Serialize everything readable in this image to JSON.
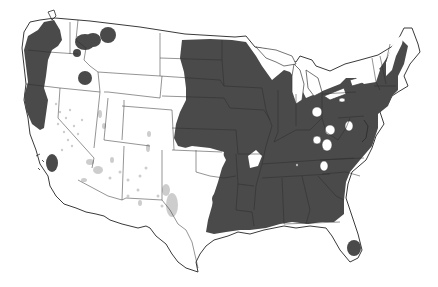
{
  "map": {
    "subject": "United States range distribution map",
    "colors": {
      "background": "#ffffff",
      "range_fill": "#4a4a4a",
      "state_border": "#3a3a3a",
      "land_fill": "#ffffff",
      "stipple": "#b8b8b8"
    },
    "regions": [
      {
        "name": "pacific-northwest-coast",
        "description": "Coastal WA, OR, northern CA"
      },
      {
        "name": "northern-idaho-patches",
        "description": "Northern Idaho / western Montana patches"
      },
      {
        "name": "central-idaho-patch",
        "description": "Small circular patch in Idaho"
      },
      {
        "name": "southern-california-patch",
        "description": "Small patch near Los Angeles"
      },
      {
        "name": "eastern-range",
        "description": "Great Plains east to Atlantic: Dakotas, MN, IA, MO, IL, IN, OH, KY, TN, AR, LA, MS, AL, GA, SC, NC, VA, PA, NY, New England"
      },
      {
        "name": "texas-patch",
        "description": "Small oval in central Texas"
      },
      {
        "name": "florida-patch",
        "description": "Small patch in southern Florida"
      }
    ],
    "stipple_areas": [
      "Nevada",
      "Utah",
      "Arizona",
      "New Mexico",
      "West Texas"
    ]
  }
}
